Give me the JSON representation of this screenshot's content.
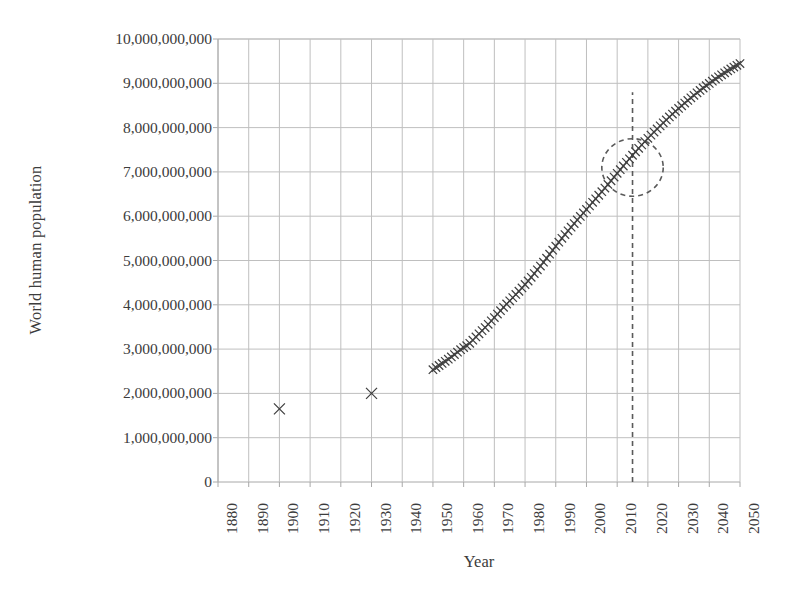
{
  "chart_data": {
    "type": "scatter",
    "title": "",
    "xlabel": "Year",
    "ylabel": "World human population",
    "xlim": [
      1880,
      2050
    ],
    "ylim": [
      0,
      10000000000
    ],
    "grid": true,
    "legend": "none",
    "xticks": [
      "1880",
      "1890",
      "1900",
      "1910",
      "1920",
      "1930",
      "1940",
      "1950",
      "1960",
      "1970",
      "1980",
      "1990",
      "2000",
      "2010",
      "2020",
      "2030",
      "2040",
      "2050"
    ],
    "yticks": [
      "0",
      "1,000,000,000",
      "2,000,000,000",
      "3,000,000,000",
      "4,000,000,000",
      "5,000,000,000",
      "6,000,000,000",
      "7,000,000,000",
      "8,000,000,000",
      "9,000,000,000",
      "10,000,000,000"
    ],
    "marker": "x",
    "marker_color": "#404040",
    "series": [
      {
        "name": "historical-isolated-points",
        "marker": "x",
        "points": [
          {
            "x": 1900,
            "y": 1650000000
          },
          {
            "x": 1930,
            "y": 2000000000
          }
        ]
      },
      {
        "name": "population-curve",
        "marker": "x",
        "points": [
          {
            "x": 1950,
            "y": 2536000000
          },
          {
            "x": 1951,
            "y": 2584000000
          },
          {
            "x": 1952,
            "y": 2630000000
          },
          {
            "x": 1953,
            "y": 2677000000
          },
          {
            "x": 1954,
            "y": 2724000000
          },
          {
            "x": 1955,
            "y": 2773000000
          },
          {
            "x": 1956,
            "y": 2824000000
          },
          {
            "x": 1957,
            "y": 2877000000
          },
          {
            "x": 1958,
            "y": 2931000000
          },
          {
            "x": 1959,
            "y": 2986000000
          },
          {
            "x": 1960,
            "y": 3035000000
          },
          {
            "x": 1961,
            "y": 3077000000
          },
          {
            "x": 1962,
            "y": 3131000000
          },
          {
            "x": 1963,
            "y": 3202000000
          },
          {
            "x": 1964,
            "y": 3275000000
          },
          {
            "x": 1965,
            "y": 3346000000
          },
          {
            "x": 1966,
            "y": 3417000000
          },
          {
            "x": 1967,
            "y": 3487000000
          },
          {
            "x": 1968,
            "y": 3560000000
          },
          {
            "x": 1969,
            "y": 3637000000
          },
          {
            "x": 1970,
            "y": 3712000000
          },
          {
            "x": 1971,
            "y": 3791000000
          },
          {
            "x": 1972,
            "y": 3867000000
          },
          {
            "x": 1973,
            "y": 3943000000
          },
          {
            "x": 1974,
            "y": 4018000000
          },
          {
            "x": 1975,
            "y": 4090000000
          },
          {
            "x": 1976,
            "y": 4162000000
          },
          {
            "x": 1977,
            "y": 4234000000
          },
          {
            "x": 1978,
            "y": 4306000000
          },
          {
            "x": 1979,
            "y": 4381000000
          },
          {
            "x": 1980,
            "y": 4458000000
          },
          {
            "x": 1981,
            "y": 4537000000
          },
          {
            "x": 1982,
            "y": 4620000000
          },
          {
            "x": 1983,
            "y": 4705000000
          },
          {
            "x": 1984,
            "y": 4789000000
          },
          {
            "x": 1985,
            "y": 4874000000
          },
          {
            "x": 1986,
            "y": 4962000000
          },
          {
            "x": 1987,
            "y": 5052000000
          },
          {
            "x": 1988,
            "y": 5143000000
          },
          {
            "x": 1989,
            "y": 5234000000
          },
          {
            "x": 1990,
            "y": 5324000000
          },
          {
            "x": 1991,
            "y": 5414000000
          },
          {
            "x": 1992,
            "y": 5501000000
          },
          {
            "x": 1993,
            "y": 5586000000
          },
          {
            "x": 1994,
            "y": 5670000000
          },
          {
            "x": 1995,
            "y": 5752000000
          },
          {
            "x": 1996,
            "y": 5834000000
          },
          {
            "x": 1997,
            "y": 5915000000
          },
          {
            "x": 1998,
            "y": 5995000000
          },
          {
            "x": 1999,
            "y": 6074000000
          },
          {
            "x": 2000,
            "y": 6153000000
          },
          {
            "x": 2001,
            "y": 6233000000
          },
          {
            "x": 2002,
            "y": 6313000000
          },
          {
            "x": 2003,
            "y": 6393000000
          },
          {
            "x": 2004,
            "y": 6473000000
          },
          {
            "x": 2005,
            "y": 6554000000
          },
          {
            "x": 2006,
            "y": 6635000000
          },
          {
            "x": 2007,
            "y": 6717000000
          },
          {
            "x": 2008,
            "y": 6800000000
          },
          {
            "x": 2009,
            "y": 6883000000
          },
          {
            "x": 2010,
            "y": 6967000000
          },
          {
            "x": 2011,
            "y": 7050000000
          },
          {
            "x": 2012,
            "y": 7133000000
          },
          {
            "x": 2013,
            "y": 7215000000
          },
          {
            "x": 2014,
            "y": 7296000000
          },
          {
            "x": 2015,
            "y": 7376000000
          },
          {
            "x": 2016,
            "y": 7455000000
          },
          {
            "x": 2017,
            "y": 7533000000
          },
          {
            "x": 2018,
            "y": 7610000000
          },
          {
            "x": 2019,
            "y": 7685000000
          },
          {
            "x": 2020,
            "y": 7758000000
          },
          {
            "x": 2021,
            "y": 7830000000
          },
          {
            "x": 2022,
            "y": 7900000000
          },
          {
            "x": 2023,
            "y": 7970000000
          },
          {
            "x": 2024,
            "y": 8039000000
          },
          {
            "x": 2025,
            "y": 8107000000
          },
          {
            "x": 2026,
            "y": 8174000000
          },
          {
            "x": 2027,
            "y": 8240000000
          },
          {
            "x": 2028,
            "y": 8305000000
          },
          {
            "x": 2029,
            "y": 8369000000
          },
          {
            "x": 2030,
            "y": 8432000000
          },
          {
            "x": 2031,
            "y": 8493000000
          },
          {
            "x": 2032,
            "y": 8554000000
          },
          {
            "x": 2033,
            "y": 8614000000
          },
          {
            "x": 2034,
            "y": 8672000000
          },
          {
            "x": 2035,
            "y": 8729000000
          },
          {
            "x": 2036,
            "y": 8785000000
          },
          {
            "x": 2037,
            "y": 8840000000
          },
          {
            "x": 2038,
            "y": 8894000000
          },
          {
            "x": 2039,
            "y": 8947000000
          },
          {
            "x": 2040,
            "y": 8998000000
          },
          {
            "x": 2041,
            "y": 9048000000
          },
          {
            "x": 2042,
            "y": 9097000000
          },
          {
            "x": 2043,
            "y": 9145000000
          },
          {
            "x": 2044,
            "y": 9192000000
          },
          {
            "x": 2045,
            "y": 9237000000
          },
          {
            "x": 2046,
            "y": 9281000000
          },
          {
            "x": 2047,
            "y": 9324000000
          },
          {
            "x": 2048,
            "y": 9366000000
          },
          {
            "x": 2049,
            "y": 9406000000
          },
          {
            "x": 2050,
            "y": 9445000000
          }
        ]
      }
    ],
    "annotations": [
      {
        "name": "present-day-marker-line",
        "type": "vertical-dashed-line",
        "x": 2015,
        "y_from": 0,
        "y_to": 8800000000,
        "color": "#5a5a5a"
      },
      {
        "name": "highlight-ellipse",
        "type": "dashed-ellipse",
        "center_x": 2015,
        "center_y": 7100000000,
        "radius_x_years": 10,
        "radius_y": 650000000,
        "color": "#5a5a5a"
      }
    ]
  },
  "style": {
    "background": "#ffffff",
    "grid_color": "#bfbfbf",
    "axis_color": "#a8a8a8",
    "text_color": "#3c3c3c",
    "marker_color": "#404040"
  }
}
